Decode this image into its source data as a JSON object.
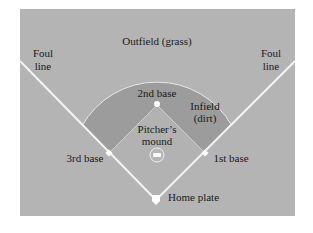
{
  "diagram": {
    "colors": {
      "background": "#ffffff",
      "outfield": "#b4b4b4",
      "infield_dirt": "#9a9a9a",
      "diamond_grass": "#b0b0b0",
      "lines": "#f4f4f4",
      "text": "#1a1a1a"
    },
    "labels": {
      "outfield": "Outfield (grass)",
      "foul_line_left_1": "Foul",
      "foul_line_left_2": "line",
      "foul_line_right_1": "Foul",
      "foul_line_right_2": "line",
      "second_base": "2nd base",
      "infield_1": "Infield",
      "infield_2": "(dirt)",
      "pitchers_mound_1": "Pitcher’s",
      "pitchers_mound_2": "mound",
      "third_base": "3rd base",
      "first_base": "1st base",
      "home_plate": "Home plate"
    }
  }
}
